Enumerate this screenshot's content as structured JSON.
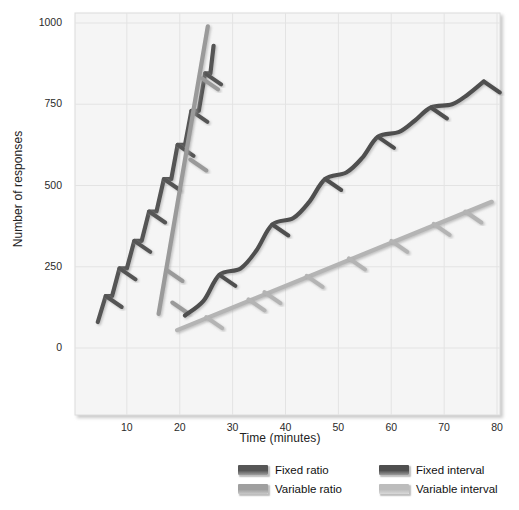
{
  "chart_data": {
    "type": "line",
    "title": "",
    "xlabel": "Time (minutes)",
    "ylabel": "Number of responses",
    "xlim": [
      0,
      80
    ],
    "ylim": [
      0,
      1000
    ],
    "xticks": [
      10,
      20,
      30,
      40,
      50,
      60,
      70,
      80
    ],
    "yticks": [
      0,
      250,
      500,
      750,
      1000
    ],
    "grid": true,
    "legend_position": "bottom",
    "colors": {
      "fixed_ratio": "#555555",
      "variable_ratio": "#9a9a9a",
      "fixed_interval": "#4f4f4f",
      "variable_interval": "#b4b4b4",
      "plot_background": "#f5f5f5",
      "grid_line": "#e3e3e3",
      "axis_text": "#222222"
    },
    "series": [
      {
        "name": "Fixed ratio",
        "color": "#555555",
        "style": "staircase",
        "description": "Steep stepwise climb with short post-reinforcement pauses",
        "points": [
          [
            4.5,
            80
          ],
          [
            6.0,
            160
          ],
          [
            7.2,
            160
          ],
          [
            8.6,
            245
          ],
          [
            10.0,
            245
          ],
          [
            11.4,
            330
          ],
          [
            12.8,
            330
          ],
          [
            14.2,
            420
          ],
          [
            15.6,
            420
          ],
          [
            17.0,
            520
          ],
          [
            18.4,
            520
          ],
          [
            19.6,
            625
          ],
          [
            21.0,
            625
          ],
          [
            22.2,
            730
          ],
          [
            23.6,
            730
          ],
          [
            24.8,
            845
          ],
          [
            25.8,
            845
          ],
          [
            26.4,
            930
          ]
        ],
        "reinforcement_marks": [
          [
            6.0,
            160
          ],
          [
            8.6,
            245
          ],
          [
            11.4,
            330
          ],
          [
            14.2,
            420
          ],
          [
            17.0,
            520
          ],
          [
            19.6,
            625
          ],
          [
            22.2,
            730
          ],
          [
            24.8,
            845
          ]
        ]
      },
      {
        "name": "Variable ratio",
        "color": "#9a9a9a",
        "style": "steady-steep",
        "description": "Near-linear very steep responding, reinforcers scattered",
        "points": [
          [
            16.0,
            105
          ],
          [
            25.3,
            990
          ]
        ],
        "reinforcement_marks": [
          [
            17.5,
            240
          ],
          [
            18.6,
            140
          ],
          [
            22.0,
            580
          ],
          [
            24.2,
            830
          ]
        ]
      },
      {
        "name": "Fixed interval",
        "color": "#4f4f4f",
        "style": "scalloped",
        "description": "Scalloped pattern: pause after reinforcement, accelerating to next interval",
        "points": [
          [
            21.0,
            100
          ],
          [
            24.5,
            145
          ],
          [
            27.5,
            225
          ],
          [
            31.5,
            245
          ],
          [
            34.5,
            300
          ],
          [
            37.5,
            380
          ],
          [
            41.5,
            400
          ],
          [
            44.5,
            450
          ],
          [
            47.5,
            520
          ],
          [
            51.5,
            540
          ],
          [
            54.5,
            585
          ],
          [
            57.5,
            650
          ],
          [
            61.5,
            665
          ],
          [
            64.5,
            700
          ],
          [
            67.5,
            740
          ],
          [
            71.5,
            750
          ],
          [
            74.5,
            780
          ],
          [
            77.5,
            820
          ]
        ],
        "reinforcement_marks": [
          [
            27.5,
            225
          ],
          [
            37.5,
            380
          ],
          [
            47.5,
            520
          ],
          [
            57.5,
            650
          ],
          [
            67.5,
            740
          ],
          [
            77.5,
            820
          ]
        ]
      },
      {
        "name": "Variable interval",
        "color": "#b4b4b4",
        "style": "steady-slow",
        "description": "Steady moderate rate of responding",
        "points": [
          [
            19.5,
            55
          ],
          [
            79.0,
            450
          ]
        ],
        "reinforcement_marks": [
          [
            25.0,
            95
          ],
          [
            33.0,
            150
          ],
          [
            36.0,
            172
          ],
          [
            44.0,
            222
          ],
          [
            52.0,
            276
          ],
          [
            60.0,
            330
          ],
          [
            68.0,
            382
          ],
          [
            74.0,
            420
          ]
        ]
      }
    ]
  },
  "axis": {
    "ylabel": "Number of responses",
    "xlabel": "Time (minutes)",
    "yticks": [
      "1000",
      "750",
      "500",
      "250",
      "0"
    ],
    "xticks": [
      "10",
      "20",
      "30",
      "40",
      "50",
      "60",
      "70",
      "80"
    ]
  },
  "legend": {
    "items": [
      {
        "label": "Fixed ratio",
        "color": "#565656"
      },
      {
        "label": "Fixed interval",
        "color": "#4f4f4f"
      },
      {
        "label": "Variable ratio",
        "color": "#9f9f9f"
      },
      {
        "label": "Variable interval",
        "color": "#bcbcbc"
      }
    ]
  }
}
